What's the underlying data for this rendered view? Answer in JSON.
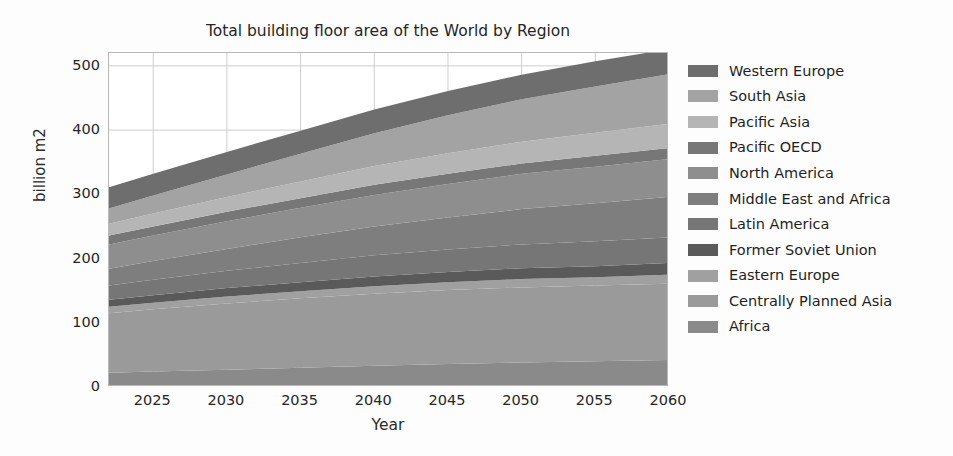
{
  "chart_data": {
    "type": "area",
    "title": "Total building floor area of the World by Region",
    "xlabel": "Year",
    "ylabel": "billion m2",
    "xlim": [
      2022,
      2060
    ],
    "ylim": [
      0,
      520
    ],
    "xticks": [
      2025,
      2030,
      2035,
      2040,
      2045,
      2050,
      2055,
      2060
    ],
    "yticks": [
      0,
      100,
      200,
      300,
      400,
      500
    ],
    "grid": true,
    "stacked": true,
    "legend_position": "right",
    "x": [
      2022,
      2025,
      2030,
      2035,
      2040,
      2045,
      2050,
      2055,
      2060
    ],
    "series": [
      {
        "name": "Africa",
        "color": "#8a8a8a",
        "values": [
          22,
          24,
          27,
          30,
          33,
          36,
          38,
          40,
          42
        ]
      },
      {
        "name": "Centrally Planned Asia",
        "color": "#9a9a9a",
        "values": [
          93,
          97,
          103,
          108,
          112,
          115,
          117,
          118,
          119
        ]
      },
      {
        "name": "Eastern Europe",
        "color": "#a0a0a0",
        "values": [
          10,
          10,
          11,
          11,
          12,
          12,
          13,
          13,
          14
        ]
      },
      {
        "name": "Former Soviet Union",
        "color": "#5a5a5a",
        "values": [
          11,
          12,
          13,
          14,
          15,
          16,
          17,
          17,
          18
        ]
      },
      {
        "name": "Latin America",
        "color": "#767676",
        "values": [
          22,
          24,
          27,
          30,
          33,
          35,
          37,
          39,
          40
        ]
      },
      {
        "name": "Middle East and Africa",
        "color": "#7e7e7e",
        "values": [
          26,
          29,
          34,
          40,
          45,
          50,
          55,
          59,
          63
        ]
      },
      {
        "name": "North America",
        "color": "#8e8e8e",
        "values": [
          38,
          40,
          43,
          46,
          49,
          52,
          55,
          57,
          59
        ]
      },
      {
        "name": "Pacific OECD",
        "color": "#777777",
        "values": [
          14,
          14,
          15,
          15,
          16,
          16,
          16,
          17,
          17
        ]
      },
      {
        "name": "Pacific Asia",
        "color": "#b5b5b5",
        "values": [
          18,
          20,
          23,
          26,
          29,
          32,
          34,
          36,
          38
        ]
      },
      {
        "name": "South Asia",
        "color": "#a3a3a3",
        "values": [
          24,
          28,
          35,
          43,
          51,
          59,
          66,
          72,
          77
        ]
      },
      {
        "name": "Western Europe",
        "color": "#6e6e6e",
        "values": [
          33,
          34,
          35,
          36,
          37,
          38,
          38,
          39,
          39
        ]
      }
    ],
    "totals": [
      311,
      332,
      366,
      399,
      432,
      461,
      486,
      507,
      526
    ]
  },
  "legend": {
    "items": [
      {
        "label": "Western Europe",
        "color": "#6e6e6e"
      },
      {
        "label": "South Asia",
        "color": "#a3a3a3"
      },
      {
        "label": "Pacific Asia",
        "color": "#b5b5b5"
      },
      {
        "label": "Pacific OECD",
        "color": "#777777"
      },
      {
        "label": "North America",
        "color": "#8e8e8e"
      },
      {
        "label": "Middle East and Africa",
        "color": "#7e7e7e"
      },
      {
        "label": "Latin America",
        "color": "#767676"
      },
      {
        "label": "Former Soviet Union",
        "color": "#5a5a5a"
      },
      {
        "label": "Eastern Europe",
        "color": "#a0a0a0"
      },
      {
        "label": "Centrally Planned Asia",
        "color": "#9a9a9a"
      },
      {
        "label": "Africa",
        "color": "#8a8a8a"
      }
    ]
  },
  "style": {
    "grid_color": "#c8c8c8",
    "axis_color": "#b9b9b9",
    "text_color": "#262626",
    "background": "#fdfdfd",
    "plot_background": "#ffffff"
  }
}
